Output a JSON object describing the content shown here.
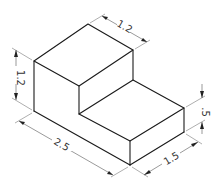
{
  "drawing": {
    "type": "isometric-view",
    "subject": "L-shaped step block",
    "line_color": "#1a1a1a",
    "dimensions": {
      "overall_height": "1.2",
      "upper_block_depth": "1.2",
      "overall_length": "2.5",
      "step_height": ".5",
      "step_depth": "1.5"
    }
  }
}
